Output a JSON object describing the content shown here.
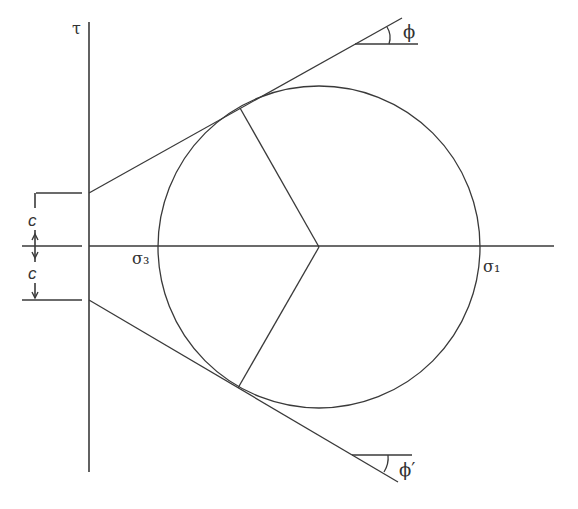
{
  "diagram": {
    "labels": {
      "tau_axis": "τ",
      "sigma3": "σ₃",
      "sigma1": "σ₁",
      "cohesion_upper": "c",
      "cohesion_lower": "c",
      "phi": "ϕ",
      "phi_prime": "ϕ′"
    },
    "colors": {
      "stroke": "#3a3a3a",
      "background": "#ffffff"
    }
  }
}
